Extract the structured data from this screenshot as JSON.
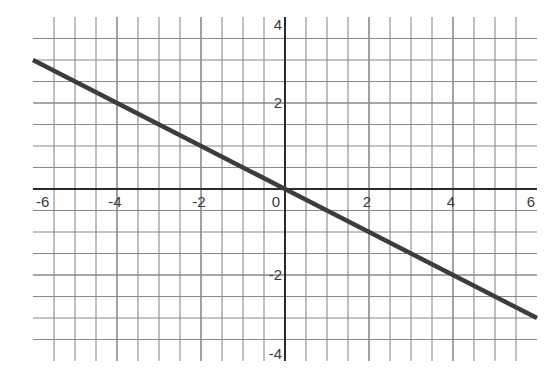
{
  "chart_data": {
    "type": "line",
    "title": "",
    "xlabel": "",
    "ylabel": "",
    "xlim": [
      -6,
      6
    ],
    "ylim": [
      -4,
      4
    ],
    "grid": true,
    "grid_step": 0.5,
    "x_ticks": [
      -6,
      -4,
      -2,
      0,
      2,
      4,
      6
    ],
    "x_tick_labels": [
      "-6",
      "-4",
      "-2",
      "0",
      "2",
      "4",
      "6"
    ],
    "y_ticks": [
      4,
      2,
      -2,
      -4
    ],
    "y_tick_labels": [
      "4",
      "2",
      "-2",
      "-4"
    ],
    "legend": null,
    "series": [
      {
        "name": "y = -0.5x",
        "equation": "y = -x/2",
        "slope": -0.5,
        "intercept": 0,
        "x": [
          -6,
          -4,
          -2,
          0,
          2,
          4,
          6
        ],
        "y": [
          3,
          2,
          1,
          0,
          -1,
          -2,
          -3
        ]
      }
    ]
  },
  "colors": {
    "background": "#ffffff",
    "grid": "#8a8a8a",
    "axis": "#2a2a2a",
    "line": "#3c3c3c",
    "label": "#3a3a3a"
  }
}
